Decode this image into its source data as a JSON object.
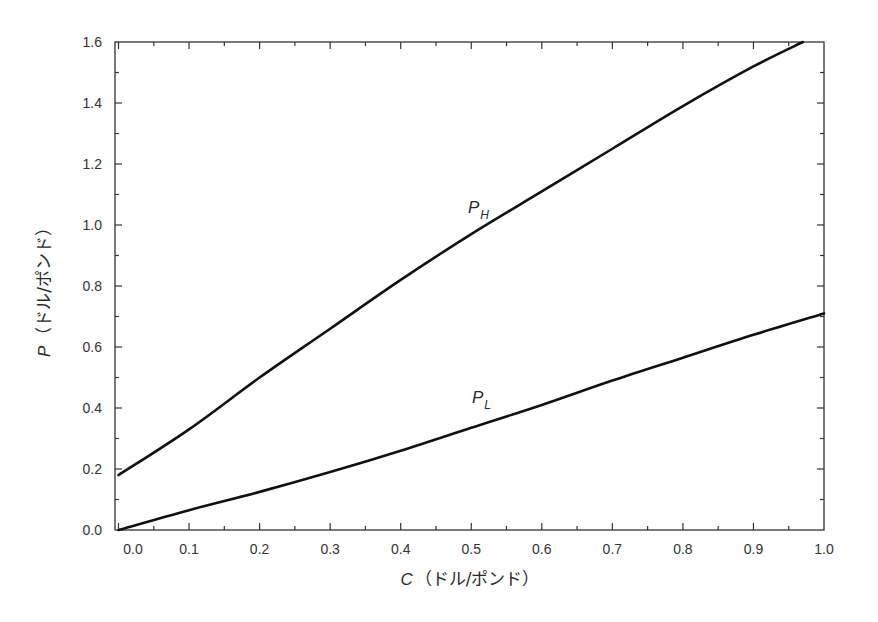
{
  "chart_data": {
    "type": "line",
    "title": "",
    "xlabel": "C（ドル/ポンド）",
    "xlabel_var": "C",
    "xlabel_unit": "（ドル/ポンド）",
    "ylabel": "P（ドル/ポンド）",
    "ylabel_var": "P",
    "ylabel_unit": "（ドル/ポンド）",
    "xlim": [
      0.0,
      1.0
    ],
    "ylim": [
      0.0,
      1.6
    ],
    "xticks": [
      "0.0",
      "0.1",
      "0.2",
      "0.3",
      "0.4",
      "0.5",
      "0.6",
      "0.7",
      "0.8",
      "0.9",
      "1.0"
    ],
    "yticks": [
      "0.0",
      "0.2",
      "0.4",
      "0.6",
      "0.8",
      "1.0",
      "1.2",
      "1.4",
      "1.6"
    ],
    "grid": false,
    "legend": "inline labels",
    "series": [
      {
        "name": "P_H",
        "label_main": "P",
        "label_sub": "H",
        "x": [
          0.0,
          0.1,
          0.2,
          0.3,
          0.4,
          0.5,
          0.6,
          0.7,
          0.8,
          0.9,
          0.97
        ],
        "values": [
          0.18,
          0.33,
          0.5,
          0.66,
          0.82,
          0.97,
          1.11,
          1.25,
          1.39,
          1.52,
          1.6
        ]
      },
      {
        "name": "P_L",
        "label_main": "P",
        "label_sub": "L",
        "x": [
          0.0,
          0.1,
          0.2,
          0.3,
          0.4,
          0.5,
          0.6,
          0.7,
          0.8,
          0.9,
          1.0
        ],
        "values": [
          0.0,
          0.065,
          0.125,
          0.19,
          0.26,
          0.335,
          0.41,
          0.49,
          0.565,
          0.64,
          0.71
        ]
      }
    ]
  }
}
